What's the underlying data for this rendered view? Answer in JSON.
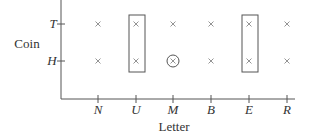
{
  "diagram": {
    "y_axis": {
      "title": "Coin",
      "ticks": [
        "T",
        "H"
      ]
    },
    "x_axis": {
      "title": "Letter",
      "ticks": [
        "N",
        "U",
        "M",
        "B",
        "E",
        "R"
      ]
    },
    "points": "x marks at every (letter, coin) pair",
    "highlighted_columns": [
      "U",
      "E"
    ],
    "circled_point": {
      "letter": "M",
      "coin": "H"
    }
  }
}
